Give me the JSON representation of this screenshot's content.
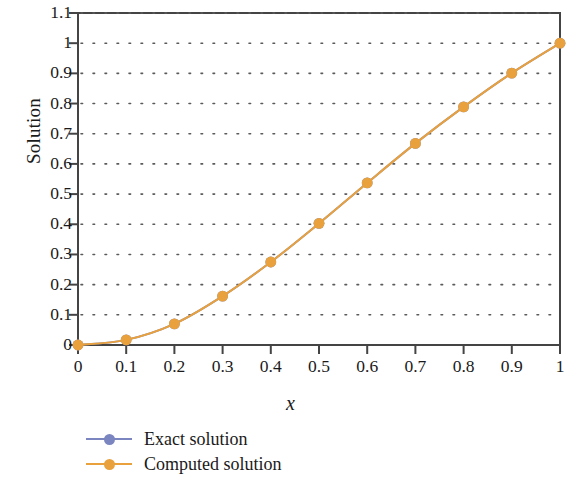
{
  "chart_data": {
    "type": "line",
    "title": "",
    "xlabel": "x",
    "ylabel": "Solution",
    "xlim": [
      0,
      1
    ],
    "ylim": [
      0,
      1.1
    ],
    "grid": "horizontal-dotted",
    "legend_position": "below-left",
    "x": [
      0,
      0.1,
      0.2,
      0.3,
      0.4,
      0.5,
      0.6,
      0.7,
      0.8,
      0.9,
      1
    ],
    "xticks": [
      "0",
      "0.1",
      "0.2",
      "0.3",
      "0.4",
      "0.5",
      "0.6",
      "0.7",
      "0.8",
      "0.9",
      "1"
    ],
    "yticks": [
      "0",
      "0.1",
      "0.2",
      "0.3",
      "0.4",
      "0.5",
      "0.6",
      "0.7",
      "0.8",
      "0.9",
      "1",
      "1.1"
    ],
    "series": [
      {
        "name": "Exact solution",
        "color": "#7b85bf",
        "marker": "circle",
        "values": [
          0,
          0.017,
          0.07,
          0.162,
          0.275,
          0.403,
          0.537,
          0.668,
          0.789,
          0.901,
          1
        ]
      },
      {
        "name": "Computed solution",
        "color": "#e8a13c",
        "marker": "circle",
        "values": [
          0,
          0.017,
          0.07,
          0.162,
          0.275,
          0.403,
          0.537,
          0.668,
          0.789,
          0.901,
          1
        ]
      }
    ]
  },
  "axes": {
    "y_title": "Solution",
    "x_title": "x"
  },
  "legend": {
    "items": [
      {
        "label": "Exact solution",
        "color": "#7b85bf"
      },
      {
        "label": "Computed solution",
        "color": "#e8a13c"
      }
    ]
  },
  "colors": {
    "exact": "#7b85bf",
    "computed": "#e8a13c",
    "axis": "#444444",
    "grid": "#5a5a5a",
    "background": "#ffffff"
  }
}
